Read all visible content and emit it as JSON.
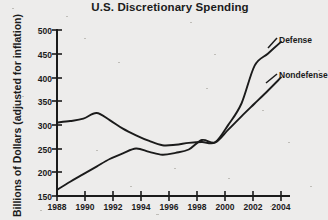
{
  "chart_data": {
    "type": "line",
    "title": "U.S. Discretionary Spending",
    "xlabel": "",
    "ylabel": "Billions of Dollars (adjusted for inflation)",
    "xlim": [
      1988,
      2005
    ],
    "ylim": [
      150,
      500
    ],
    "grid": false,
    "legend_position": "inline-right-end-labels",
    "xticks": [
      "1988",
      "1990",
      "1992",
      "1994",
      "1996",
      "1998",
      "2000",
      "2002",
      "2004"
    ],
    "yticks": [
      "150",
      "200",
      "250",
      "300",
      "350",
      "400",
      "450",
      "500"
    ],
    "x": [
      1988,
      1989,
      1990,
      1991,
      1992,
      1993,
      1994,
      1995,
      1996,
      1997,
      1998,
      1999,
      2000,
      2001,
      2002,
      2003,
      2004,
      2005
    ],
    "series": [
      {
        "name": "Defense",
        "color": "#1b1b1b",
        "values": [
          305,
          308,
          313,
          325,
          310,
          292,
          278,
          266,
          257,
          258,
          262,
          264,
          263,
          300,
          345,
          425,
          450,
          475
        ]
      },
      {
        "name": "Nondefense",
        "color": "#1b1b1b",
        "values": [
          163,
          180,
          196,
          212,
          228,
          240,
          250,
          243,
          237,
          241,
          248,
          268,
          263,
          290,
          318,
          345,
          372,
          400
        ]
      }
    ],
    "annotations": [
      {
        "text": "Defense",
        "x": 2005,
        "y": 475
      },
      {
        "text": "Nondefense",
        "x": 2005,
        "y": 400
      }
    ]
  },
  "axis": {
    "y_label_text": "Billions of Dollars (adjusted for inflation)",
    "title_text": "U.S. Discretionary Spending"
  }
}
